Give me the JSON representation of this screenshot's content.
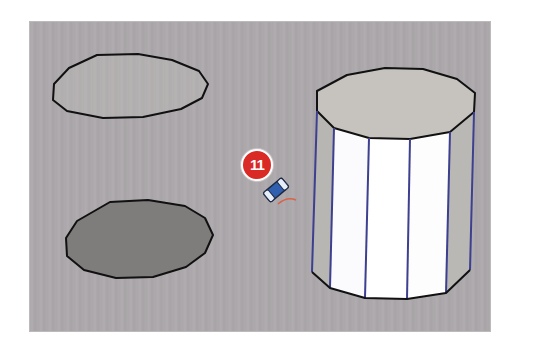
{
  "scene": {
    "background_color": "#aba8aa",
    "edge_color": "#111111",
    "vertical_edge_color": "#3d3f8f",
    "face_front_color": "#ffffff",
    "face_side_color": "#bbbab6",
    "top_face_color": "#c7c4bf",
    "filled_circle_color": "#7e7d7c",
    "shapes": [
      {
        "name": "unfilled-polygon-circle",
        "description": "Outlined 12-sided circle, unfilled"
      },
      {
        "name": "filled-polygon-circle",
        "description": "Outlined 12-sided circle with gray face"
      },
      {
        "name": "extruded-cylinder",
        "description": "12-sided prism extruded from a circle"
      }
    ]
  },
  "callout": {
    "number": "11",
    "color": "#d92a26"
  },
  "cursor": {
    "tool": "eraser-tool-cursor"
  }
}
